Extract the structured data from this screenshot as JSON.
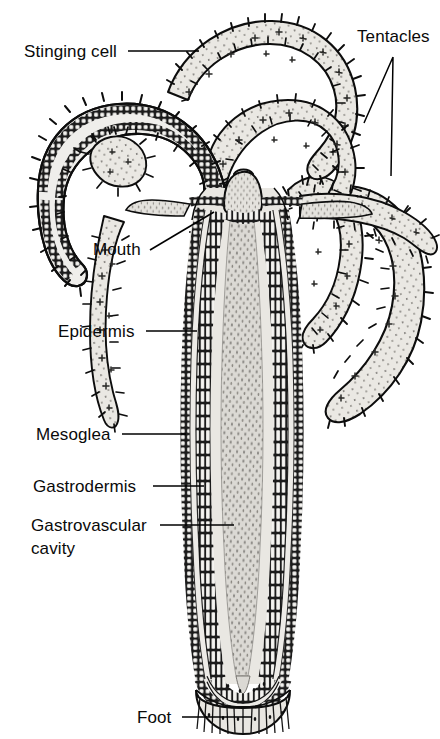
{
  "figure": {
    "background_color": "#ffffff",
    "ink_color": "#000000"
  },
  "labels": [
    {
      "id": "stinging-cell",
      "text": "Stinging cell",
      "text_x": 24,
      "text_y": 57,
      "anchor": "start",
      "leader": "M128 51 L199 51"
    },
    {
      "id": "tentacles",
      "text": "Tentacles",
      "text_x": 357,
      "text_y": 42,
      "anchor": "start",
      "leader": "M393 57 L364 123 M393 57 L391 176"
    },
    {
      "id": "mouth",
      "text": "Mouth",
      "text_x": 93,
      "text_y": 255,
      "anchor": "start",
      "leader": "M150 250 L214 212"
    },
    {
      "id": "epidermis",
      "text": "Epidermis",
      "text_x": 58,
      "text_y": 337,
      "anchor": "start",
      "leader": "M146 331 L197 331"
    },
    {
      "id": "mesoglea",
      "text": "Mesoglea",
      "text_x": 36,
      "text_y": 440,
      "anchor": "start",
      "leader": "M122 434 L186 434"
    },
    {
      "id": "gastrodermis",
      "text": "Gastrodermis",
      "text_x": 33,
      "text_y": 492,
      "anchor": "start",
      "leader": "M153 486 L204 486"
    },
    {
      "id": "gastrovascular-cavity",
      "text": "Gastrovascular",
      "text_x": 31,
      "text_y": 531,
      "anchor": "start",
      "leader": "M160 525 L234 525"
    },
    {
      "id": "gastrovascular-cavity-line2",
      "text": "cavity",
      "text_x": 31,
      "text_y": 554,
      "anchor": "start",
      "leader": ""
    },
    {
      "id": "foot",
      "text": "Foot",
      "text_x": 137,
      "text_y": 723,
      "anchor": "start",
      "leader": "M182 717 L252 717"
    }
  ],
  "structures": {
    "body_column": "body-column",
    "hypostome": "hypostome-mouth-cone",
    "basal_disc": "foot-basal-disc",
    "tentacle_count_visible": 6,
    "layers": [
      "epidermis",
      "mesoglea",
      "gastrodermis",
      "gastrovascular cavity"
    ]
  },
  "palette": {
    "cavity_fill": "#d9d7d2",
    "tissue_fill": "#e6e4df",
    "tentacle_fill": "#e9e7e2",
    "cell_fill": "#f5f4f1",
    "mesoglea_fill": "#eceae6",
    "dark_ink": "#111111",
    "mid_gray": "#8a8a86"
  }
}
